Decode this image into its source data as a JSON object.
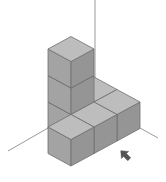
{
  "diagram": {
    "type": "isometric-block-structure",
    "cube_count": 7,
    "grid_unit": {
      "half_width": 23,
      "half_height": 12.5,
      "height": 26.5
    },
    "origin": [
      71,
      127
    ],
    "cubes": [
      {
        "x": 1,
        "y": 1,
        "z": 0
      },
      {
        "x": 1,
        "y": 1,
        "z": 1
      },
      {
        "x": 1,
        "y": 1,
        "z": 2
      },
      {
        "x": 2,
        "y": 1,
        "z": 0
      },
      {
        "x": 2,
        "y": 0,
        "z": 0
      },
      {
        "x": 1,
        "y": 0,
        "z": 0
      },
      {
        "x": 0,
        "y": 0,
        "z": 0
      }
    ],
    "axes": {
      "vertical": {
        "from": [
          95,
          0
        ],
        "to": [
          95,
          88
        ]
      },
      "left": {
        "from": [
          8,
          151
        ],
        "to": [
          48,
          128
        ]
      },
      "right": {
        "from": [
          140,
          128
        ],
        "to": [
          158,
          138
        ]
      }
    },
    "arrow": {
      "direction": "up-left",
      "position": [
        125,
        155
      ],
      "meaning": "viewing direction"
    },
    "colors": {
      "top": "#bdbdbd",
      "left": "#a3a3a3",
      "right": "#959595",
      "edge": "#6e6e6e",
      "axis": "#9a9a9a",
      "arrow": "#555555",
      "background": "#ffffff"
    }
  }
}
